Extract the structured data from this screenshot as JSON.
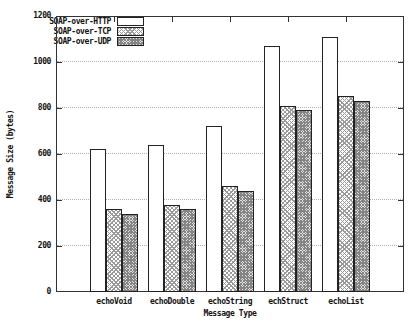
{
  "chart_data": {
    "type": "bar",
    "title": "",
    "xlabel": "Message Type",
    "ylabel": "Message Size (bytes)",
    "categories": [
      "echoVoid",
      "echoDouble",
      "echoString",
      "echStruct",
      "echoList"
    ],
    "series": [
      {
        "name": "SOAP-over-HTTP",
        "pattern": "empty",
        "values": [
          620,
          640,
          720,
          1070,
          1110
        ]
      },
      {
        "name": "SOAP-over-TCP",
        "pattern": "light-crosshatch",
        "values": [
          360,
          380,
          460,
          810,
          850
        ]
      },
      {
        "name": "SOAP-over-UDP",
        "pattern": "dense-crosshatch",
        "values": [
          340,
          360,
          440,
          790,
          830
        ]
      }
    ],
    "ylim": [
      0,
      1200
    ],
    "yticks": [
      0,
      200,
      400,
      600,
      800,
      1000,
      1200
    ],
    "grid": "horizontal-dotted",
    "legend_position": "top-left-inside"
  },
  "colors": {
    "background": "#ffffff",
    "frame": "#333333",
    "gridline": "#b0b0b0",
    "text": "#111111",
    "bar_border": "#222222"
  }
}
